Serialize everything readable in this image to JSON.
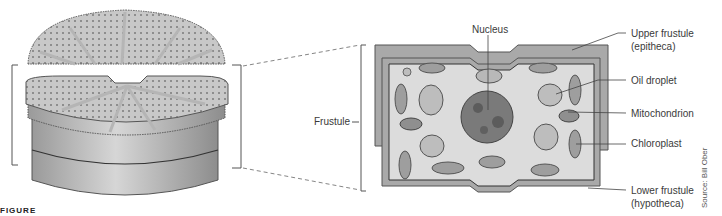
{
  "figure": {
    "caption_fragment": "FIGURE",
    "credit": "Source: Bill Ober"
  },
  "labels": {
    "frustule": "Frustule",
    "nucleus": "Nucleus",
    "upper_frustule": "Upper frustule",
    "upper_frustule_alt": "(epitheca)",
    "oil_droplet": "Oil droplet",
    "mitochondrion": "Mitochondrion",
    "chloroplast": "Chloroplast",
    "lower_frustule": "Lower frustule",
    "lower_frustule_alt": "(hypotheca)"
  },
  "colors": {
    "frustule_wall": "#a9a9a9",
    "cytoplasm": "#dcdcdc",
    "organelle": "#9e9e9e",
    "nucleus": "#7a7a7a",
    "line": "#444444"
  }
}
